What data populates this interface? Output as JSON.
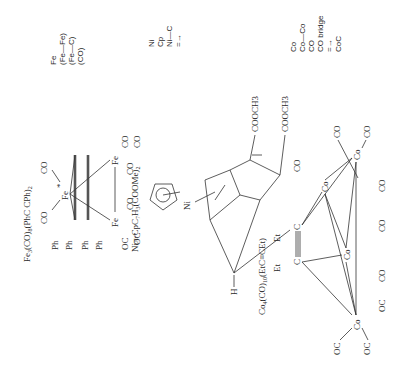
{
  "figure": {
    "orientation": "rotated 90deg counter-clockwise",
    "structures": [
      {
        "id": "fe3",
        "title": "Fe3(CO)8(PhC CPh)2",
        "title_parts": [
          "Fe",
          "3",
          "(CO)",
          "8",
          "(PhC CPh)",
          "2"
        ],
        "atoms": {
          "fe_top": "Fe",
          "fe_top_mark": "*",
          "fe_left": "Fe",
          "fe_right": "Fe",
          "fe_right_mark": "*",
          "c": "C",
          "ph": "Ph",
          "co": "CO",
          "oc": "OC"
        }
      },
      {
        "id": "ni",
        "title": "Niπ-CpC7H3(COOMe)2",
        "title_parts": [
          "Niπ-CpC",
          "7",
          "H",
          "3",
          "(COOMe)",
          "2"
        ],
        "atoms": {
          "ni": "Ni",
          "h": "H",
          "cooch3_a": "COOCH3",
          "cooch3_b": "COOCH3"
        }
      },
      {
        "id": "co4",
        "title": "Co4(CO)10(EtC≡CEt)",
        "title_parts": [
          "Co",
          "4",
          "(CO)",
          "10",
          "(EtC≡CEt)"
        ],
        "atoms": {
          "co": "Co",
          "co_mark": "*",
          "c": "C",
          "et": "Et",
          "co_ligand": "CO",
          "oc_ligand": "OC"
        }
      }
    ],
    "legends": [
      {
        "id": "fe-legend",
        "lines": [
          "Fe",
          "(Fe—Fe)",
          "(Fe—C)",
          "(CO)"
        ]
      },
      {
        "id": "ni-legend",
        "lines": [
          "Ni",
          "Cp",
          "Ni—C",
          "=→"
        ]
      },
      {
        "id": "co-legend",
        "lines": [
          "Co",
          "Co—Co",
          "CO",
          "CO bridge",
          "=→",
          "CoC"
        ]
      }
    ]
  }
}
